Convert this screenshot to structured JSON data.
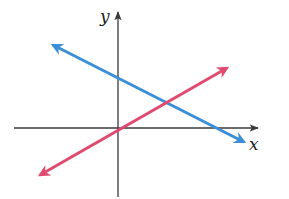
{
  "diagram": {
    "type": "coordinate-plane",
    "axes": {
      "x_label": "x",
      "y_label": "y",
      "color": "#3a3a3a"
    },
    "lines": [
      {
        "name": "blue-line",
        "color": "#3b8fd9",
        "slope_sign": "negative",
        "x1": 53,
        "y1": 45,
        "x2": 244,
        "y2": 142
      },
      {
        "name": "red-line",
        "color": "#e04a6e",
        "slope_sign": "positive",
        "passes_through_origin": true,
        "x1": 40,
        "y1": 175,
        "x2": 227,
        "y2": 68
      }
    ],
    "intersection": "first quadrant"
  }
}
